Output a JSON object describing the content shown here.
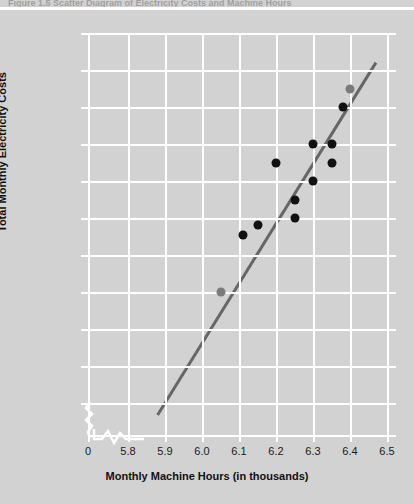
{
  "chart_data": {
    "type": "scatter",
    "title": "Figure 1.5  Scatter Diagram of Electricity Costs and Machine Hours",
    "xlabel": "Monthly Machine Hours (in thousands)",
    "ylabel": "Total Monthly Electricity Costs",
    "xlim": [
      5.75,
      6.5
    ],
    "ylim": [
      22900,
      25000
    ],
    "grid": true,
    "legend": false,
    "x_ticks": [
      "0",
      "5.8",
      "5.9",
      "6.0",
      "6.1",
      "6.2",
      "6.3",
      "6.4",
      "6.5"
    ],
    "x_tick_values": [
      5.75,
      5.8,
      5.9,
      6.0,
      6.1,
      6.2,
      6.3,
      6.4,
      6.5
    ],
    "y_ticks": [
      "$25,000",
      "$24,800",
      "$24,600",
      "$24,400",
      "$24,200",
      "$24,000",
      "$23,800",
      "$23,600",
      "$23,400",
      "$23,200",
      "$23,000",
      "0"
    ],
    "y_tick_values": [
      25000,
      24800,
      24600,
      24400,
      24200,
      24000,
      23800,
      23600,
      23400,
      23200,
      23000,
      22900
    ],
    "axis_break_x": true,
    "axis_break_y": true,
    "points": [
      {
        "x": 6.11,
        "y": 23910,
        "color": "#111111"
      },
      {
        "x": 6.15,
        "y": 23960,
        "color": "#111111"
      },
      {
        "x": 6.2,
        "y": 24300,
        "color": "#111111"
      },
      {
        "x": 6.25,
        "y": 24100,
        "color": "#111111"
      },
      {
        "x": 6.25,
        "y": 24000,
        "color": "#111111"
      },
      {
        "x": 6.3,
        "y": 24400,
        "color": "#111111"
      },
      {
        "x": 6.3,
        "y": 24200,
        "color": "#111111"
      },
      {
        "x": 6.35,
        "y": 24400,
        "color": "#111111"
      },
      {
        "x": 6.35,
        "y": 24300,
        "color": "#111111"
      },
      {
        "x": 6.38,
        "y": 24600,
        "color": "#111111"
      }
    ],
    "regression_line": {
      "color": "#666666",
      "x1": 5.88,
      "y1": 22935,
      "x2": 6.47,
      "y2": 24840,
      "endpoints": [
        {
          "x": 6.05,
          "y": 23600,
          "color": "#7a7a7a"
        },
        {
          "x": 6.4,
          "y": 24700,
          "color": "#7a7a7a"
        }
      ]
    },
    "series_note": "Ten observed cost/hour pairs with fitted cost line"
  }
}
